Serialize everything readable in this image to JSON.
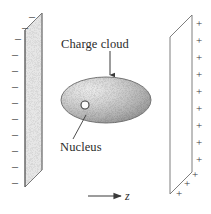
{
  "figure": {
    "width": 211,
    "height": 214,
    "background": "#ffffff",
    "ink_color": "#2b2b2b"
  },
  "labels": {
    "charge_cloud": "Charge cloud",
    "nucleus": "Nucleus",
    "z_axis": "z"
  },
  "left_plate": {
    "name": "negative-plate",
    "charge_symbol": "–",
    "charge_sign": "negative",
    "count": 12,
    "fill": "#e9e9e9",
    "stroke": "#6a6a6a",
    "outline": [
      [
        25,
        30
      ],
      [
        42,
        13
      ],
      [
        42,
        170
      ],
      [
        25,
        187
      ]
    ],
    "signs": [
      {
        "x": 29,
        "y": 10
      },
      {
        "x": 22,
        "y": 21
      },
      {
        "x": 15,
        "y": 32
      },
      {
        "x": 12,
        "y": 48
      },
      {
        "x": 12,
        "y": 64
      },
      {
        "x": 12,
        "y": 80
      },
      {
        "x": 12,
        "y": 96
      },
      {
        "x": 12,
        "y": 112
      },
      {
        "x": 12,
        "y": 128
      },
      {
        "x": 12,
        "y": 144
      },
      {
        "x": 12,
        "y": 160
      },
      {
        "x": 12,
        "y": 176
      }
    ]
  },
  "right_plate": {
    "name": "positive-plate",
    "charge_symbol": "+",
    "charge_sign": "positive",
    "count": 12,
    "fill": "#ffffff",
    "stroke": "#6a6a6a",
    "outline": [
      [
        170,
        37
      ],
      [
        192,
        15
      ],
      [
        192,
        172
      ],
      [
        170,
        194
      ]
    ],
    "signs": [
      {
        "x": 196,
        "y": 18
      },
      {
        "x": 196,
        "y": 35
      },
      {
        "x": 196,
        "y": 52
      },
      {
        "x": 196,
        "y": 69
      },
      {
        "x": 196,
        "y": 86
      },
      {
        "x": 196,
        "y": 103
      },
      {
        "x": 196,
        "y": 120
      },
      {
        "x": 196,
        "y": 137
      },
      {
        "x": 196,
        "y": 154
      },
      {
        "x": 192,
        "y": 169
      },
      {
        "x": 184,
        "y": 178
      },
      {
        "x": 176,
        "y": 188
      }
    ]
  },
  "charge_cloud": {
    "name": "charge-cloud-ellipse",
    "center_x": 106,
    "center_y": 100,
    "radius_x": 45,
    "radius_y": 23,
    "fill_light": "#e2e2e2",
    "fill_dark": "#9a9a9a",
    "stroke": "#707070",
    "texture": "stippled"
  },
  "nucleus": {
    "name": "nucleus-circle",
    "center_x": 85,
    "center_y": 105,
    "radius": 4,
    "fill": "#fbfbfb",
    "stroke": "#4a4a4a"
  },
  "annotations": [
    {
      "name": "charge-cloud-leader",
      "from_x": 110,
      "from_y": 51,
      "to_x": 110,
      "to_y": 76,
      "arrowhead": "down"
    },
    {
      "name": "nucleus-leader",
      "from_x": 74,
      "from_y": 140,
      "to_x": 86,
      "to_y": 116,
      "arrowhead": "none"
    },
    {
      "name": "z-axis-arrow",
      "from_x": 88,
      "from_y": 196,
      "to_x": 122,
      "to_y": 196,
      "arrowhead": "right"
    }
  ]
}
